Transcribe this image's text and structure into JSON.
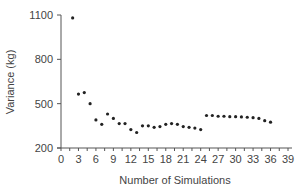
{
  "chart_data": {
    "type": "scatter",
    "title": "",
    "xlabel": "Number of Simulations",
    "ylabel": "Variance  (kg)",
    "xlim": [
      0,
      39
    ],
    "ylim": [
      200,
      1100
    ],
    "xticks": [
      0,
      3,
      6,
      9,
      12,
      15,
      18,
      21,
      24,
      27,
      30,
      33,
      36,
      39
    ],
    "yticks": [
      200,
      500,
      800,
      1100
    ],
    "grid": false,
    "legend": null,
    "x": [
      2,
      3,
      4,
      5,
      6,
      7,
      8,
      9,
      10,
      11,
      12,
      13,
      14,
      15,
      16,
      17,
      18,
      19,
      20,
      21,
      22,
      23,
      24,
      25,
      26,
      27,
      28,
      29,
      30,
      31,
      32,
      33,
      34,
      35,
      36
    ],
    "y": [
      1080,
      565,
      575,
      500,
      390,
      360,
      430,
      400,
      365,
      365,
      325,
      305,
      350,
      350,
      340,
      345,
      360,
      365,
      360,
      345,
      340,
      335,
      325,
      420,
      420,
      415,
      415,
      412,
      412,
      410,
      408,
      405,
      400,
      385,
      375
    ],
    "marker_color": "#222222",
    "axis_color": "#555555"
  }
}
